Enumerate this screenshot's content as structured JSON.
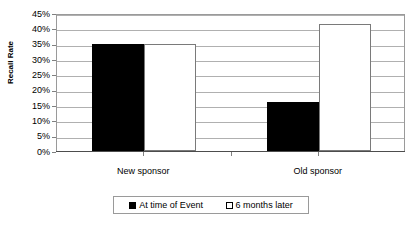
{
  "chart_data": {
    "type": "bar",
    "title": "",
    "xlabel": "",
    "ylabel": "Recall Rate",
    "categories": [
      "New sponsor",
      "Old sponsor"
    ],
    "series": [
      {
        "name": "At time of Event",
        "values": [
          35,
          16
        ],
        "swatch": "dark",
        "color": "#000000"
      },
      {
        "name": "6 months later",
        "values": [
          35,
          41.5
        ],
        "swatch": "light",
        "color": "#ffffff"
      }
    ],
    "ylim": [
      0,
      45
    ],
    "ytick_step": 5,
    "ytick_labels": [
      "45%",
      "40%",
      "35%",
      "30%",
      "25%",
      "20%",
      "15%",
      "10%",
      "5%",
      "0%"
    ],
    "ytick_values": [
      45,
      40,
      35,
      30,
      25,
      20,
      15,
      10,
      5,
      0
    ],
    "grid": true,
    "legend_position": "bottom",
    "value_format": "percent"
  },
  "colors": {
    "plot_border": "#9a9a9a",
    "gridline": "#b0b0b0",
    "axis": "#4d4d4d",
    "text": "#000000",
    "background": "#ffffff"
  }
}
